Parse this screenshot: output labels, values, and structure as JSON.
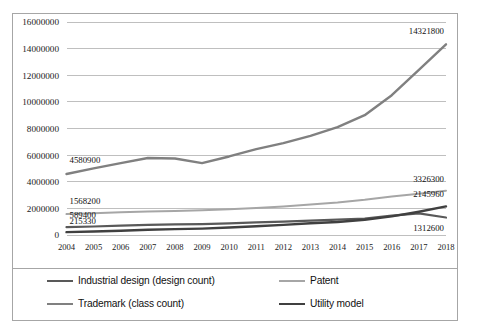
{
  "chart_data": {
    "type": "line",
    "title": "",
    "xlabel": "",
    "ylabel": "",
    "grid": true,
    "legend_position": "bottom",
    "ylim": [
      0,
      16000000
    ],
    "ytick_step": 2000000,
    "yticks": [
      "0",
      "2000000",
      "4000000",
      "6000000",
      "8000000",
      "10000000",
      "12000000",
      "14000000",
      "16000000"
    ],
    "categories": [
      "2004",
      "2005",
      "2006",
      "2007",
      "2008",
      "2009",
      "2010",
      "2011",
      "2012",
      "2013",
      "2014",
      "2015",
      "2016",
      "2017",
      "2018"
    ],
    "series": [
      {
        "name": "Industrial design (design count)",
        "color": "#595959",
        "width": 2.2,
        "values": [
          589400,
          640000,
          700000,
          760000,
          800000,
          820000,
          880000,
          950000,
          1010000,
          1080000,
          1150000,
          1240000,
          1450000,
          1620000,
          1312600
        ],
        "labels": {
          "first": "589400",
          "last": "1312600"
        }
      },
      {
        "name": "Patent",
        "color": "#a6a6a6",
        "width": 2.0,
        "values": [
          1568200,
          1630000,
          1700000,
          1760000,
          1810000,
          1850000,
          1930000,
          2030000,
          2150000,
          2300000,
          2450000,
          2650000,
          2900000,
          3100000,
          3326300
        ],
        "labels": {
          "first": "1568200",
          "last": "3326300"
        }
      },
      {
        "name": "Trademark (class count)",
        "color": "#808080",
        "width": 2.4,
        "values": [
          4580900,
          5000000,
          5400000,
          5780000,
          5750000,
          5400000,
          5900000,
          6450000,
          6900000,
          7450000,
          8100000,
          9000000,
          10500000,
          12400000,
          14321800
        ],
        "labels": {
          "first": "4580900",
          "last": "14321800"
        }
      },
      {
        "name": "Utility model",
        "color": "#404040",
        "width": 2.4,
        "values": [
          215330,
          260000,
          320000,
          390000,
          440000,
          480000,
          560000,
          660000,
          760000,
          880000,
          980000,
          1150000,
          1400000,
          1750000,
          2145960
        ],
        "labels": {
          "first": "215330",
          "last": "2145960"
        }
      }
    ],
    "data_labels": [
      {
        "text": "4580900",
        "series": "Trademark (class count)",
        "at": "2004"
      },
      {
        "text": "1568200",
        "series": "Patent",
        "at": "2004"
      },
      {
        "text": "589400",
        "series": "Industrial design (design count)",
        "at": "2004"
      },
      {
        "text": "215330",
        "series": "Utility model",
        "at": "2004"
      },
      {
        "text": "14321800",
        "series": "Trademark (class count)",
        "at": "2018"
      },
      {
        "text": "3326300",
        "series": "Patent",
        "at": "2018"
      },
      {
        "text": "2145960",
        "series": "Utility model",
        "at": "2018"
      },
      {
        "text": "1312600",
        "series": "Industrial design (design count)",
        "at": "2018"
      }
    ]
  },
  "legend": {
    "items": [
      {
        "label": "Industrial design (design count)",
        "color": "#595959"
      },
      {
        "label": "Patent",
        "color": "#a6a6a6"
      },
      {
        "label": "Trademark (class count)",
        "color": "#808080"
      },
      {
        "label": "Utility model",
        "color": "#404040"
      }
    ]
  }
}
